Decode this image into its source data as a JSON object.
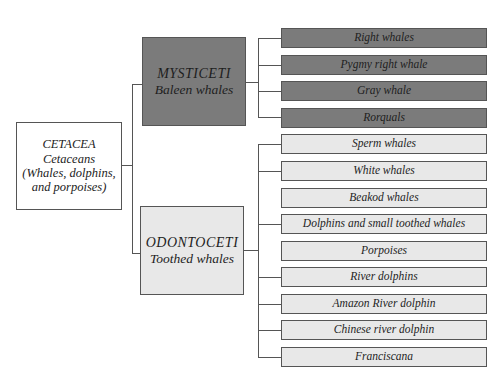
{
  "root": {
    "title": "CETACEA",
    "common": "Cetaceans",
    "desc1": "(Whales, dolphins,",
    "desc2": "and porpoises)"
  },
  "suborders": [
    {
      "title": "MYSTICETI",
      "common": "Baleen whales",
      "color": "#7b7b7b",
      "families": [
        "Right whales",
        "Pygmy right whale",
        "Gray whale",
        "Rorquals"
      ]
    },
    {
      "title": "ODONTOCETI",
      "common": "Toothed whales",
      "color": "#e8e8e8",
      "families": [
        "Sperm whales",
        "White whales",
        "Beakod whales",
        "Dolphins and small toothed whales",
        "Porpoises",
        "River dolphins",
        "Amazon River dolphin",
        "Chinese river dolphin",
        "Franciscana"
      ]
    }
  ]
}
